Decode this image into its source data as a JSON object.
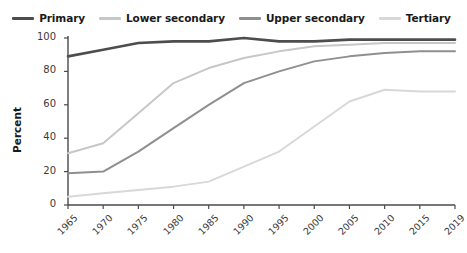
{
  "legend": {
    "position": "top-center",
    "items": [
      {
        "label": "Primary",
        "color": "#4d4d4d",
        "icon": "line-swatch-icon"
      },
      {
        "label": "Lower secondary",
        "color": "#c7c7c7",
        "icon": "line-swatch-icon"
      },
      {
        "label": "Upper secondary",
        "color": "#8f8f8f",
        "icon": "line-swatch-icon"
      },
      {
        "label": "Tertiary",
        "color": "#d8d8d8",
        "icon": "line-swatch-icon"
      }
    ]
  },
  "axes": {
    "ylabel": "Percent",
    "yticks": [
      "0",
      "20",
      "40",
      "60",
      "80",
      "100"
    ],
    "xticks": [
      "1965",
      "1970",
      "1975",
      "1980",
      "1985",
      "1990",
      "1995",
      "2000",
      "2005",
      "2010",
      "2015",
      "2019"
    ]
  },
  "chart_data": {
    "type": "line",
    "title": "",
    "subtitle": "",
    "xlabel": "",
    "ylabel": "Percent",
    "x": [
      1965,
      1970,
      1975,
      1980,
      1985,
      1990,
      1995,
      2000,
      2005,
      2010,
      2015,
      2019
    ],
    "categories": [
      "1965",
      "1970",
      "1975",
      "1980",
      "1985",
      "1990",
      "1995",
      "2000",
      "2005",
      "2010",
      "2015",
      "2019"
    ],
    "xlim": [
      1965,
      2019
    ],
    "ylim": [
      0,
      100
    ],
    "grid": false,
    "legend_position": "top-center",
    "series": [
      {
        "name": "Primary",
        "color": "#4d4d4d",
        "values": [
          89,
          93,
          97,
          98,
          98,
          100,
          98,
          98,
          99,
          99,
          99,
          99
        ]
      },
      {
        "name": "Lower secondary",
        "color": "#c7c7c7",
        "values": [
          31,
          37,
          55,
          73,
          82,
          88,
          92,
          95,
          96,
          97,
          97,
          97
        ]
      },
      {
        "name": "Upper secondary",
        "color": "#8f8f8f",
        "values": [
          19,
          20,
          32,
          46,
          60,
          73,
          80,
          86,
          89,
          91,
          92,
          92
        ]
      },
      {
        "name": "Tertiary",
        "color": "#d8d8d8",
        "values": [
          5,
          7,
          9,
          11,
          14,
          23,
          32,
          47,
          62,
          69,
          68,
          68
        ]
      }
    ]
  }
}
